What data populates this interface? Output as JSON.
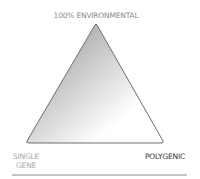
{
  "diagram": {
    "apex_label": "100% ENVIRONMENTAL",
    "left_label_line1": "SINGLE",
    "left_label_line2": "GENE",
    "right_label": "POLYGENIC",
    "colors": {
      "gradient_dark": "#8f8f8f",
      "gradient_light": "#ffffff",
      "stroke": "#6e6e6e",
      "baseline": "#8a8a8a"
    }
  }
}
